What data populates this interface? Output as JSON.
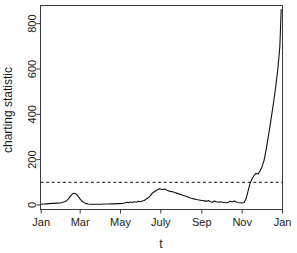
{
  "chart_data": {
    "type": "line",
    "title": "",
    "subtitle": "",
    "xlabel": "t",
    "ylabel": "charting statistic",
    "grid": false,
    "legend": false,
    "legend_position": "none",
    "xlim": [
      0,
      366
    ],
    "ylim": [
      -20,
      880
    ],
    "ytick_values": [
      0,
      200,
      400,
      600,
      800
    ],
    "ytick_labels": [
      "0",
      "200",
      "400",
      "600",
      "800"
    ],
    "xtick_positions": [
      1,
      60,
      121,
      182,
      244,
      305,
      366
    ],
    "xtick_labels": [
      "Jan",
      "Mar",
      "May",
      "July",
      "Sep",
      "Nov",
      "Jan"
    ],
    "annotations": [
      {
        "name": "control-limit",
        "type": "hline",
        "value": 100,
        "style": "dashed",
        "label": ""
      }
    ],
    "series": [
      {
        "name": "charting statistic",
        "style": "solid",
        "x": [
          1,
          5,
          9,
          13,
          17,
          21,
          25,
          29,
          33,
          36,
          39,
          42,
          45,
          48,
          51,
          54,
          57,
          60,
          64,
          68,
          72,
          76,
          80,
          84,
          88,
          92,
          96,
          100,
          104,
          108,
          112,
          116,
          120,
          124,
          127,
          130,
          133,
          136,
          139,
          142,
          145,
          148,
          151,
          154,
          157,
          160,
          163,
          166,
          169,
          172,
          176,
          180,
          184,
          188,
          192,
          196,
          200,
          204,
          208,
          212,
          216,
          220,
          224,
          228,
          232,
          236,
          240,
          244,
          248,
          251,
          254,
          257,
          260,
          263,
          266,
          269,
          272,
          275,
          278,
          281,
          284,
          287,
          290,
          293,
          296,
          299,
          302,
          305,
          308,
          311,
          314,
          317,
          320,
          323,
          326,
          329,
          332,
          335,
          338,
          341,
          344,
          347,
          350,
          353,
          356,
          359,
          362,
          364
        ],
        "y": [
          3,
          4,
          5,
          6,
          7,
          7,
          8,
          9,
          11,
          14,
          18,
          26,
          38,
          48,
          52,
          48,
          38,
          26,
          14,
          7,
          4,
          3,
          3,
          3,
          3,
          3,
          4,
          4,
          4,
          5,
          5,
          6,
          6,
          7,
          9,
          12,
          10,
          13,
          11,
          14,
          12,
          16,
          14,
          18,
          20,
          26,
          32,
          40,
          52,
          58,
          66,
          72,
          68,
          70,
          64,
          60,
          58,
          54,
          50,
          46,
          42,
          38,
          34,
          30,
          27,
          24,
          22,
          20,
          18,
          16,
          20,
          14,
          12,
          18,
          14,
          12,
          14,
          12,
          11,
          10,
          12,
          16,
          14,
          17,
          13,
          11,
          10,
          9,
          11,
          28,
          62,
          96,
          116,
          130,
          140,
          136,
          150,
          168,
          196,
          240,
          292,
          346,
          404,
          462,
          528,
          600,
          700,
          862
        ]
      }
    ]
  },
  "axes": {
    "y_axis_name": "charting-statistic-axis",
    "x_axis_name": "time-axis"
  }
}
